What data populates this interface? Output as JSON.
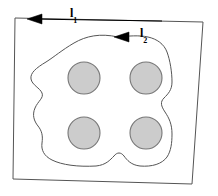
{
  "figure": {
    "type": "contour-integration-diagram",
    "background_color": "#ffffff",
    "width": 218,
    "height": 196
  },
  "labels": {
    "outer_path": {
      "symbol": "l",
      "subscript": "1"
    },
    "inner_path": {
      "symbol": "l",
      "subscript": "2"
    }
  },
  "outer_boundary": {
    "name": "outer-quadrilateral",
    "stroke_color": "#555555",
    "fill": "none",
    "stroke_width": 1,
    "points": "15,18 203,22 192,184 13,179"
  },
  "outer_arrow": {
    "name": "outer-direction-arrow",
    "color": "#000000",
    "direction": "left",
    "line": {
      "x1": 162,
      "y1": 21,
      "x2": 30,
      "y2": 19
    },
    "head": "27,19 42,14 42,24"
  },
  "inner_contour": {
    "name": "inner-irregular-contour",
    "stroke_color": "#555555",
    "fill": "none",
    "stroke_width": 1,
    "path": "M 118 37 C 100 33 86 36 74 43 C 62 50 54 57 46 62 C 36 68 30 73 31 79 C 32 85 40 88 42 93 C 44 98 38 101 35 108 C 32 115 34 121 38 126 C 42 131 43 136 42 143 C 41 150 44 156 52 160 C 62 165 78 167 96 166 C 106 165 110 160 114 156 C 117 152 121 152 124 156 C 127 160 131 165 140 166 C 152 167 162 164 167 157 C 171 151 172 143 172 134 C 172 124 169 118 165 112 C 161 106 160 102 164 98 C 168 94 172 90 172 82 C 172 72 170 60 167 52 C 164 44 157 39 148 37 C 139 35 128 36 118 37 Z"
  },
  "inner_arrow": {
    "name": "inner-direction-arrow",
    "color": "#000000",
    "direction": "left",
    "head": "114,37 129,32 129,42"
  },
  "circles": {
    "fill_color": "#cccccc",
    "stroke_color": "#777777",
    "radius": 16,
    "items": [
      {
        "name": "circle-top-left",
        "cx": 84,
        "cy": 78
      },
      {
        "name": "circle-top-right",
        "cx": 146,
        "cy": 78
      },
      {
        "name": "circle-bottom-left",
        "cx": 84,
        "cy": 133
      },
      {
        "name": "circle-bottom-right",
        "cx": 146,
        "cy": 133
      }
    ]
  }
}
